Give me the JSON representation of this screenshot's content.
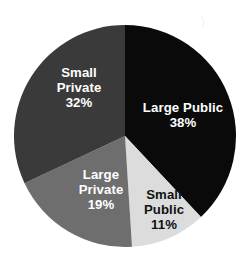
{
  "chart_data": {
    "type": "pie",
    "title": "",
    "subtitle": "",
    "xlabel": "",
    "ylabel": "",
    "legend_position": "none",
    "labels_inside_slices": true,
    "total_percent": 100,
    "categories": [
      "Large Public",
      "Small Public",
      "Large Private",
      "Small Private"
    ],
    "values": [
      38,
      11,
      19,
      32
    ],
    "value_suffix": "%",
    "start_angle_deg": 0,
    "direction": "clockwise",
    "slices": [
      {
        "label": "Large Public",
        "label_line1": "Large",
        "label_line2": "Public",
        "label_single_line": "Large Public",
        "value": 38,
        "value_text": "38%",
        "color": "#0a0a0a",
        "text_color": "#ffffff",
        "start_angle_deg": 0,
        "end_angle_deg": 136.8
      },
      {
        "label": "Small Public",
        "label_line1": "Small",
        "label_line2": "Public",
        "label_single_line": "Small Public",
        "value": 11,
        "value_text": "11%",
        "color": "#dcdcdc",
        "text_color": "#111111",
        "start_angle_deg": 136.8,
        "end_angle_deg": 176.4
      },
      {
        "label": "Large Private",
        "label_line1": "Large",
        "label_line2": "Private",
        "label_single_line": "Large Private",
        "value": 19,
        "value_text": "19%",
        "color": "#6e6e6e",
        "text_color": "#ffffff",
        "start_angle_deg": 176.4,
        "end_angle_deg": 244.8
      },
      {
        "label": "Small Private",
        "label_line1": "Small",
        "label_line2": "Private",
        "label_single_line": "Small Private",
        "value": 32,
        "value_text": "32%",
        "color": "#3a3a3a",
        "text_color": "#ffffff",
        "start_angle_deg": 244.8,
        "end_angle_deg": 360
      }
    ],
    "background_color": "#ffffff",
    "geometry": {
      "center_x": 125,
      "center_y": 136,
      "radius": 111
    }
  }
}
